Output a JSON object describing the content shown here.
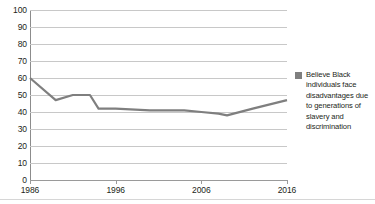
{
  "chart_data": {
    "type": "line",
    "title": "",
    "xlabel": "",
    "ylabel": "",
    "xlim": [
      1986,
      2016
    ],
    "ylim": [
      0,
      100
    ],
    "grid": true,
    "legend_position": "right",
    "y_ticks": [
      100,
      90,
      80,
      70,
      60,
      50,
      40,
      30,
      20,
      10,
      0
    ],
    "x_ticks": [
      1986,
      1996,
      2006,
      2016
    ],
    "x_tick_labels": [
      "1986",
      "1996",
      "2006",
      "2016"
    ],
    "series": [
      {
        "name": "Believe Black individuals face disadvantages due to generations of slavery and discrimination",
        "color": "#7f7f7f",
        "x": [
          1986,
          1989,
          1991,
          1993,
          1994,
          1996,
          2000,
          2004,
          2006,
          2008,
          2009,
          2012,
          2016
        ],
        "values": [
          60,
          47,
          50,
          50,
          42,
          42,
          41,
          41,
          40,
          39,
          38,
          42,
          47
        ]
      }
    ]
  },
  "legend": {
    "items": [
      {
        "label": "Believe Black individuals face disadvantages due to generations of slavery and discrimination",
        "color": "#7f7f7f"
      }
    ]
  }
}
